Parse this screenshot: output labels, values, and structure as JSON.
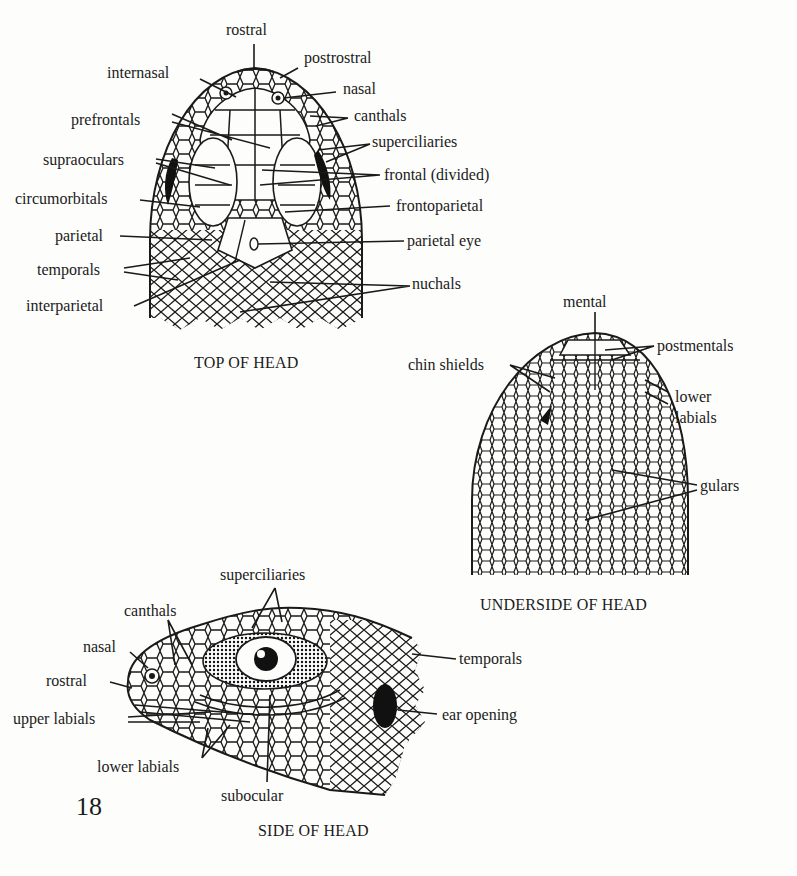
{
  "page": {
    "page_number": "18",
    "background": "#fdfdfb",
    "ink": "#1a1a1a"
  },
  "figures": {
    "top": {
      "caption": "TOP OF HEAD",
      "labels": {
        "rostral": "rostral",
        "postrostral": "postrostral",
        "internasal": "internasal",
        "nasal": "nasal",
        "canthals": "canthals",
        "prefrontals": "prefrontals",
        "superciliaries": "superciliaries",
        "supraoculars": "supraoculars",
        "frontal": "frontal (divided)",
        "circumorbitals": "circumorbitals",
        "frontoparietal": "frontoparietal",
        "parietal": "parietal",
        "parietal_eye": "parietal eye",
        "temporals": "temporals",
        "nuchals": "nuchals",
        "interparietal": "interparietal"
      }
    },
    "underside": {
      "caption": "UNDERSIDE OF HEAD",
      "labels": {
        "mental": "mental",
        "postmentals": "postmentals",
        "chin_shields": "chin shields",
        "lower_labials_1": "lower",
        "lower_labials_2": "labials",
        "gulars": "gulars"
      }
    },
    "side": {
      "caption": "SIDE OF HEAD",
      "labels": {
        "superciliaries": "superciliaries",
        "canthals": "canthals",
        "nasal": "nasal",
        "temporals": "temporals",
        "rostral": "rostral",
        "upper_labials": "upper labials",
        "ear_opening": "ear opening",
        "lower_labials": "lower labials",
        "subocular": "subocular"
      }
    }
  }
}
